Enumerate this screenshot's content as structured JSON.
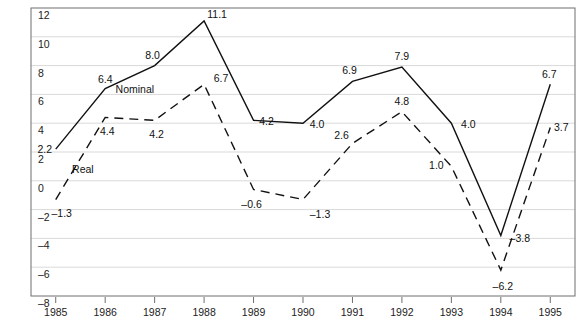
{
  "top_clipped_text": "",
  "chart_data": {
    "type": "line",
    "title": "",
    "xlabel": "",
    "ylabel": "",
    "x": [
      1985,
      1986,
      1987,
      1988,
      1989,
      1990,
      1991,
      1992,
      1993,
      1994,
      1995
    ],
    "xtick_labels": [
      "1985",
      "1986",
      "1987",
      "1988",
      "1989",
      "1990",
      "1991",
      "1992",
      "1993",
      "1994",
      "1995"
    ],
    "ylim": [
      -8,
      12
    ],
    "ytick_values": [
      12,
      10,
      8,
      6,
      4,
      2,
      0,
      -2,
      -4,
      -6,
      -8
    ],
    "ytick_labels": [
      "12",
      "10",
      "8",
      "6",
      "4",
      "2",
      "0",
      "–2",
      "–4",
      "–6",
      "–8"
    ],
    "grid": true,
    "grid_color": "#d9d9d9",
    "frame_color": "#6e6e6e",
    "legend": "inline-labels",
    "series": [
      {
        "name": "Nominal",
        "style": "solid",
        "color": "#111111",
        "label_position": {
          "x": 1986.6,
          "y": 6.35
        },
        "values": [
          2.2,
          6.4,
          8.0,
          11.1,
          4.2,
          4.0,
          6.9,
          7.9,
          4.0,
          -3.8,
          6.7
        ],
        "point_labels": [
          "2.2",
          "6.4",
          "8.0",
          "11.1",
          "4.2",
          "4.0",
          "6.9",
          "7.9",
          "4.0",
          "–3.8",
          "6.7"
        ]
      },
      {
        "name": "Real",
        "style": "dashed",
        "color": "#111111",
        "label_position": {
          "x": 1985.55,
          "y": 0.85
        },
        "values": [
          -1.3,
          4.4,
          4.2,
          6.7,
          -0.6,
          -1.3,
          2.6,
          4.8,
          1.0,
          -6.2,
          3.7
        ],
        "point_labels": [
          "–1.3",
          "4.4",
          "4.2",
          "6.7",
          "–0.6",
          "–1.3",
          "2.6",
          "4.8",
          "1.0",
          "–6.2",
          "3.7"
        ]
      }
    ]
  }
}
